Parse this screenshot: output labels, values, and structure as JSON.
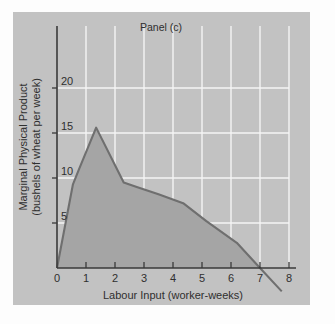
{
  "chart_data": {
    "type": "area",
    "title": "Panel (c)",
    "xlabel": "Labour Input (worker-weeks)",
    "ylabel": "Marginal Physical Product\n(bushels of wheat per week)",
    "ylabel_line1": "Marginal Physical Product",
    "ylabel_line2": "(bushels of wheat per week)",
    "xlim": [
      0,
      8
    ],
    "ylim": [
      0,
      23
    ],
    "xticks": [
      0,
      1,
      2,
      3,
      4,
      5,
      6,
      7,
      8
    ],
    "xtick_labels": [
      "0",
      "1",
      "2",
      "3",
      "4",
      "5",
      "6",
      "7",
      "8"
    ],
    "yticks": [
      5,
      10,
      15,
      20
    ],
    "ytick_labels": [
      "5",
      "10",
      "15",
      "20"
    ],
    "grid": true,
    "grid_vertical_at": [
      1,
      2,
      3,
      4,
      5,
      6,
      7,
      8
    ],
    "grid_horizontal_at": [
      5,
      10,
      15,
      20
    ],
    "legend": null,
    "series": [
      {
        "name": "Marginal Physical Product",
        "fill": true,
        "points": [
          {
            "x": 0.0,
            "y": 0.0
          },
          {
            "x": 0.55,
            "y": 9.3
          },
          {
            "x": 0.75,
            "y": 10.9
          },
          {
            "x": 1.35,
            "y": 15.6
          },
          {
            "x": 2.3,
            "y": 9.5
          },
          {
            "x": 2.75,
            "y": 9.0
          },
          {
            "x": 3.5,
            "y": 8.2
          },
          {
            "x": 4.35,
            "y": 7.2
          },
          {
            "x": 5.15,
            "y": 5.2
          },
          {
            "x": 6.2,
            "y": 2.8
          },
          {
            "x": 7.0,
            "y": 0.0
          },
          {
            "x": 7.75,
            "y": -2.6
          }
        ]
      }
    ]
  },
  "colors": {
    "panel_background": "#c2c2c2",
    "area_fill": "#a5a5a5",
    "curve_stroke": "#6f6f6f",
    "gridline": "#f4f4f4",
    "axis": "#3a3a3a",
    "text": "#2f2f2f",
    "page_background": "#fdfdfd"
  }
}
